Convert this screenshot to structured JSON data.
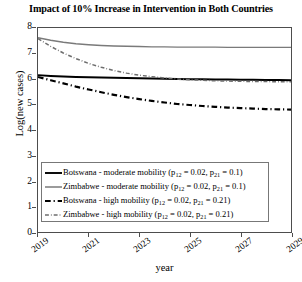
{
  "chart_data": {
    "type": "line",
    "title": "Impact of 10% Increase in Intervention in Both Countries",
    "xlabel": "year",
    "ylabel": "Log(new cases)",
    "xlim": [
      2019,
      2029
    ],
    "ylim": [
      0,
      8
    ],
    "grid": false,
    "legend_position": "lower-center-inside",
    "xticks": [
      "2019",
      "2021",
      "2023",
      "2025",
      "2027",
      "2029"
    ],
    "xtick_values": [
      2019,
      2021,
      2023,
      2025,
      2027,
      2029
    ],
    "yticks": [
      "0",
      "1",
      "2",
      "3",
      "4",
      "5",
      "6",
      "7",
      "8"
    ],
    "ytick_values": [
      0,
      1,
      2,
      3,
      4,
      5,
      6,
      7,
      8
    ],
    "x": [
      2019,
      2019.5,
      2020,
      2020.5,
      2021,
      2021.5,
      2022,
      2022.5,
      2023,
      2023.5,
      2024,
      2024.5,
      2025,
      2025.5,
      2026,
      2026.5,
      2027,
      2027.5,
      2028,
      2028.5,
      2029
    ],
    "series": [
      {
        "name": "Botswana - moderate mobility (p12 = 0.02, p21 = 0.1)",
        "country": "Botswana",
        "mobility": "moderate",
        "p12": 0.02,
        "p21": 0.1,
        "color": "#000000",
        "style": "solid",
        "width": 1.9,
        "values": [
          6.15,
          6.12,
          6.1,
          6.08,
          6.07,
          6.06,
          6.05,
          6.04,
          6.03,
          6.02,
          6.01,
          6.0,
          5.99,
          5.99,
          5.98,
          5.98,
          5.97,
          5.97,
          5.96,
          5.96,
          5.95
        ]
      },
      {
        "name": "Zimbabwe - moderate mobility (p12 = 0.02, p21 = 0.1)",
        "country": "Zimbabwe",
        "mobility": "moderate",
        "p12": 0.02,
        "p21": 0.1,
        "color": "#7a7a7a",
        "style": "solid",
        "width": 1.5,
        "values": [
          7.62,
          7.52,
          7.44,
          7.38,
          7.34,
          7.31,
          7.29,
          7.28,
          7.27,
          7.26,
          7.26,
          7.25,
          7.25,
          7.25,
          7.25,
          7.24,
          7.24,
          7.24,
          7.24,
          7.24,
          7.24
        ]
      },
      {
        "name": "Botswana - high mobility (p12 = 0.02, p21 = 0.21)",
        "country": "Botswana",
        "mobility": "high",
        "p12": 0.02,
        "p21": 0.21,
        "color": "#000000",
        "style": "dashdot",
        "width": 2.2,
        "values": [
          6.08,
          5.95,
          5.83,
          5.7,
          5.59,
          5.48,
          5.38,
          5.29,
          5.21,
          5.14,
          5.08,
          5.02,
          4.98,
          4.94,
          4.91,
          4.88,
          4.86,
          4.84,
          4.82,
          4.81,
          4.8
        ]
      },
      {
        "name": "Zimbabwe - high mobility (p12 = 0.02, p21 = 0.21)",
        "country": "Zimbabwe",
        "mobility": "high",
        "p12": 0.02,
        "p21": 0.21,
        "color": "#6e6e6e",
        "style": "dashdot",
        "width": 1.5,
        "values": [
          7.58,
          7.28,
          7.02,
          6.8,
          6.61,
          6.46,
          6.33,
          6.23,
          6.15,
          6.09,
          6.04,
          6.0,
          5.97,
          5.95,
          5.93,
          5.92,
          5.91,
          5.9,
          5.9,
          5.89,
          5.89
        ]
      }
    ]
  },
  "legend": {
    "entries": [
      {
        "prefix": "Botswana - moderate mobility (p",
        "sub1": "12",
        "mid": " = 0.02, p",
        "sub2": "21",
        "suffix": " = 0.1)"
      },
      {
        "prefix": "Zimbabwe - moderate mobility (p",
        "sub1": "12",
        "mid": " = 0.02, p",
        "sub2": "21",
        "suffix": " = 0.1)"
      },
      {
        "prefix": "Botswana - high mobility (p",
        "sub1": "12",
        "mid": " = 0.02, p",
        "sub2": "21",
        "suffix": " = 0.21)"
      },
      {
        "prefix": "Zimbabwe - high mobility (p",
        "sub1": "12",
        "mid": " = 0.02, p",
        "sub2": "21",
        "suffix": " = 0.21)"
      }
    ]
  },
  "colors": {
    "axis": "#4d4d4d",
    "botswana": "#000000",
    "zimbabwe": "#7a7a7a",
    "background": "#ffffff"
  }
}
